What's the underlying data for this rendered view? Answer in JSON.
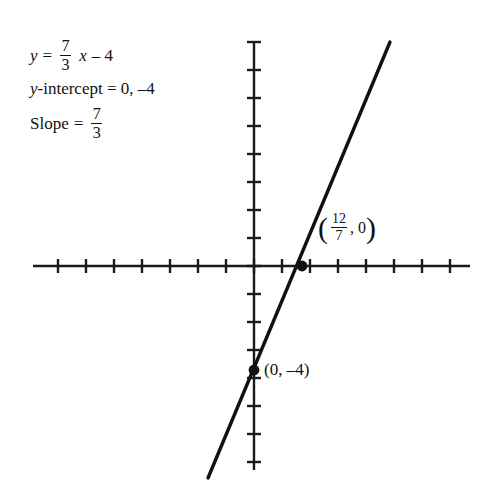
{
  "annotations": {
    "equation": {
      "lhs": "y",
      "equals": "=",
      "slope_num": "7",
      "slope_den": "3",
      "variable": "x",
      "constant": "– 4"
    },
    "y_intercept": {
      "label": "y",
      "text": "-intercept = 0, –4"
    },
    "slope": {
      "label": "Slope",
      "equals": "=",
      "num": "7",
      "den": "3"
    }
  },
  "graph": {
    "axis_color": "#1a1a1a",
    "line_color": "#111111",
    "point_color": "#111111",
    "x_axis": {
      "start_px": 33,
      "end_px": 470,
      "y_px": 266
    },
    "y_axis": {
      "start_px": 42,
      "end_px": 470,
      "x_px": 254
    },
    "origin": {
      "x_px": 254,
      "y_px": 266
    },
    "tick_spacing_px": 28,
    "tick_half_length_px": 7,
    "line_endpoints": {
      "x1_px": 208,
      "y1_px": 478,
      "x2_px": 390,
      "y2_px": 42
    }
  },
  "points": [
    {
      "name": "x-intercept",
      "label_num": "12",
      "label_den": "7",
      "label_rest": ", 0",
      "open_paren": "(",
      "close_paren": ")",
      "x_px": 302,
      "y_px": 266
    },
    {
      "name": "y-intercept",
      "label": "(0, –4)",
      "x_px": 254,
      "y_px": 370
    }
  ],
  "chart_data": {
    "type": "line",
    "title": "",
    "xlabel": "",
    "ylabel": "",
    "equation": "y = (7/3)x - 4",
    "slope": 2.3333,
    "intercept": -4,
    "xlim": [
      -7.9,
      7.7
    ],
    "ylim": [
      -7.3,
      8
    ],
    "grid": false,
    "tick_labels_shown": false,
    "annotated_points": [
      {
        "label": "(12/7, 0)",
        "x": 1.7143,
        "y": 0
      },
      {
        "label": "(0, -4)",
        "x": 0,
        "y": -4
      }
    ]
  }
}
